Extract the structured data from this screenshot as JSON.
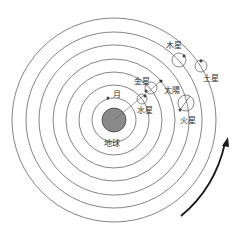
{
  "diagram": {
    "type": "geocentric model (Ptolemaic)",
    "center": "地球",
    "labels": {
      "earth": "地球",
      "moon": "月",
      "mercury": "水星",
      "venus": "金星",
      "sun": "太陽",
      "mars": "火星",
      "jupiter": "木星",
      "saturn": "土星"
    },
    "orbit_count": 7,
    "direction": "counterclockwise arrow",
    "colors": {
      "earth_fill": "#8a8a8a",
      "lines": "#555555",
      "arrow": "#1a1a1a"
    }
  }
}
